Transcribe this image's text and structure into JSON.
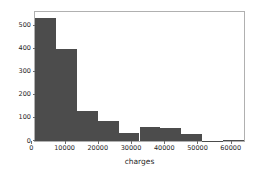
{
  "chart_data": {
    "type": "bar",
    "title": "",
    "xlabel": "charges",
    "ylabel": "",
    "grid": false,
    "legend": null,
    "xlim": [
      1100,
      64000
    ],
    "ylim": [
      0,
      560
    ],
    "xticks": [
      "0",
      "10000",
      "20000",
      "30000",
      "40000",
      "50000",
      "60000"
    ],
    "xtick_values": [
      0,
      10000,
      20000,
      30000,
      40000,
      50000,
      60000
    ],
    "yticks": [
      "0",
      "100",
      "200",
      "300",
      "400",
      "500"
    ],
    "ytick_values": [
      0,
      100,
      200,
      300,
      400,
      500
    ],
    "bin_edges": [
      1100,
      7390,
      13680,
      19970,
      26260,
      32550,
      38840,
      45130,
      51420,
      57710,
      64000
    ],
    "categories": [
      "1100-7390",
      "7390-13680",
      "13680-19970",
      "19970-26260",
      "26260-32550",
      "32550-38840",
      "38840-45130",
      "45130-51420",
      "51420-57710",
      "57710-64000"
    ],
    "values": [
      535,
      398,
      129,
      86,
      35,
      59,
      57,
      32,
      2,
      3
    ],
    "bar_color": "#4c4c4c",
    "axes_color": "#b0b0b0",
    "tick_color": "#262626",
    "background_color": "#ffffff"
  }
}
